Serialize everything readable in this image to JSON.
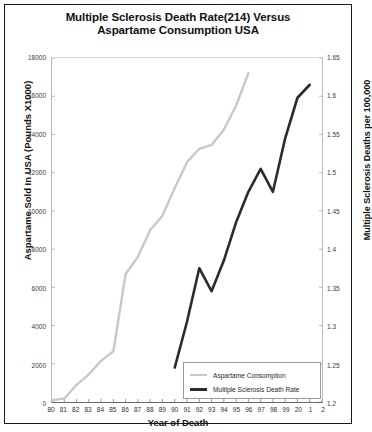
{
  "chart_data": {
    "type": "line",
    "title": "Multiple Sclerosis Death Rate(214) Versus Aspartame Consumption USA",
    "title_line1": "Multiple Sclerosis Death Rate(214) Versus",
    "title_line2": "Aspartame Consumption USA",
    "xlabel": "Year of Death",
    "ylabel_left": "Aspartame Sold In USA (Pounds X1000)",
    "ylabel_right": "Multiple Sclerosis Deaths per 100,000",
    "x_tick_labels": [
      "80",
      "81",
      "82",
      "83",
      "84",
      "85",
      "86",
      "87",
      "88",
      "89",
      "90",
      "91",
      "92",
      "93",
      "94",
      "95",
      "96",
      "97",
      "98",
      "99",
      "20",
      "1",
      "2"
    ],
    "x_values": [
      1980,
      1981,
      1982,
      1983,
      1984,
      1985,
      1986,
      1987,
      1988,
      1989,
      1990,
      1991,
      1992,
      1993,
      1994,
      1995,
      1996,
      1997,
      1998,
      1999,
      2000,
      2001,
      2002
    ],
    "xlim": [
      1980,
      2002
    ],
    "y_left_ticks": [
      0,
      2000,
      4000,
      6000,
      8000,
      10000,
      12000,
      14000,
      16000,
      18000
    ],
    "y_left_tick_labels": [
      "0",
      "2000",
      "4000",
      "6000",
      "8000",
      "10000",
      "12000",
      "14000",
      "16000",
      "18000"
    ],
    "ylim_left": [
      0,
      18000
    ],
    "y_right_ticks": [
      1.2,
      1.25,
      1.3,
      1.35,
      1.4,
      1.45,
      1.5,
      1.55,
      1.6,
      1.65
    ],
    "y_right_tick_labels": [
      "1.2",
      "1.25",
      "1.3",
      "1.35",
      "1.4",
      "1.45",
      "1.5",
      "1.55",
      "1.6",
      "1.65"
    ],
    "ylim_right": [
      1.2,
      1.65
    ],
    "grid": false,
    "legend_position": "bottom-right",
    "series": [
      {
        "name": "Aspartame Consumption",
        "axis": "left",
        "color": "#c8c8c8",
        "x": [
          1980,
          1981,
          1982,
          1983,
          1984,
          1985,
          1986,
          1987,
          1988,
          1989,
          1990,
          1991,
          1992,
          1993,
          1994,
          1995,
          1996
        ],
        "values": [
          100,
          180,
          900,
          1450,
          2150,
          2650,
          6700,
          7600,
          9000,
          9750,
          11200,
          12550,
          13250,
          13450,
          14250,
          15500,
          17200
        ]
      },
      {
        "name": "Multiple Sclerosis Death Rate",
        "axis": "right",
        "color": "#2b2b2b",
        "x": [
          1990,
          1991,
          1992,
          1993,
          1994,
          1995,
          1996,
          1997,
          1998,
          1999,
          2000,
          2001
        ],
        "values": [
          1.245,
          1.305,
          1.375,
          1.345,
          1.385,
          1.435,
          1.475,
          1.505,
          1.475,
          1.545,
          1.598,
          1.615
        ]
      }
    ],
    "legend": [
      {
        "label": "Aspartame Consumption",
        "color": "#c8c8c8",
        "style": "thin"
      },
      {
        "label": "Multiple Sclerosis Death Rate",
        "color": "#2b2b2b",
        "style": "thick"
      }
    ]
  }
}
